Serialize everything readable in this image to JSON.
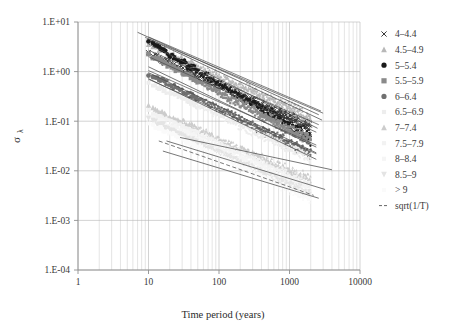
{
  "chart_data": {
    "type": "scatter",
    "title": "",
    "xlabel": "Time period (years)",
    "ylabel": "σλ",
    "xscale": "log",
    "yscale": "log",
    "xlim": [
      1,
      10000
    ],
    "ylim": [
      0.0001,
      10
    ],
    "xticks": [
      "1",
      "10",
      "100",
      "1000",
      "10000"
    ],
    "xtick_values": [
      1,
      10,
      100,
      1000,
      10000
    ],
    "yticks": [
      "1.E+01",
      "1.E+00",
      "1.E-01",
      "1.E-02",
      "1.E-03",
      "1.E-04"
    ],
    "ytick_values": [
      10,
      1,
      0.1,
      0.01,
      0.001,
      0.0001
    ],
    "grid": "both-log-minor",
    "legend_position": "right",
    "series": [
      {
        "name": "4–4.4",
        "marker": "cross",
        "color": "#3a3a3a",
        "x_start": 10,
        "x_end": 2000,
        "y_start": 2.3,
        "y_end": 0.075,
        "trend_y_start": 2.7,
        "trend_y_end": 0.085,
        "trend_x_end": 2600,
        "spread": 0.16
      },
      {
        "name": "4.5–4.9",
        "marker": "triangle",
        "color": "#b8b8b8",
        "x_start": 10,
        "x_end": 2000,
        "y_start": 3.6,
        "y_end": 0.115,
        "trend_y_start": 4.6,
        "trend_y_end": 0.145,
        "trend_x_end": 3000,
        "spread": 0.17
      },
      {
        "name": "5–5.4",
        "marker": "circle",
        "color": "#1a1a1a",
        "x_start": 10,
        "x_end": 2000,
        "y_start": 4.0,
        "y_end": 0.046,
        "trend_y_start": 5.0,
        "trend_y_end": 0.16,
        "trend_x_end": 2800,
        "spread": 0.15
      },
      {
        "name": "5.5–5.9",
        "marker": "square",
        "color": "#8a8a8a",
        "x_start": 10,
        "x_end": 2000,
        "y_start": 2.2,
        "y_end": 0.04,
        "trend_y_start": 2.0,
        "trend_y_end": 0.06,
        "trend_x_end": 2400,
        "spread": 0.15
      },
      {
        "name": "6–6.4",
        "marker": "circle",
        "color": "#707070",
        "x_start": 10,
        "x_end": 2000,
        "y_start": 0.88,
        "y_end": 0.022,
        "trend_y_start": 1.05,
        "trend_y_end": 0.033,
        "trend_x_end": 2400,
        "spread": 0.14
      },
      {
        "name": "6.5–6.9",
        "marker": "none",
        "color": "#ededed",
        "x_start": 10,
        "x_end": 2000,
        "y_start": 0.6,
        "y_end": 0.018,
        "trend_y_start": 0.7,
        "trend_y_end": 0.022,
        "trend_x_end": 2400,
        "spread": 0.14
      },
      {
        "name": "7–7.4",
        "marker": "triangle",
        "color": "#cccccc",
        "x_start": 10,
        "x_end": 2000,
        "y_start": 0.2,
        "y_end": 0.0062,
        "trend_y_start": 0.24,
        "trend_y_end": 0.0075,
        "trend_x_end": 2400,
        "spread": 0.14
      },
      {
        "name": "7.5–7.9",
        "marker": "none",
        "color": "#f2f2f2",
        "x_start": 10,
        "x_end": 2000,
        "y_start": 0.16,
        "y_end": 0.005,
        "trend_y_start": 0.19,
        "trend_y_end": 0.0058,
        "trend_x_end": 2400,
        "spread": 0.13
      },
      {
        "name": "8–8.4",
        "marker": "none",
        "color": "#f5f5f5",
        "x_start": 10,
        "x_end": 2000,
        "y_start": 0.13,
        "y_end": 0.004,
        "trend_y_start": 0.15,
        "trend_y_end": 0.0046,
        "trend_x_end": 2400,
        "spread": 0.13
      },
      {
        "name": "8.5–9",
        "marker": "triangle-down",
        "color": "#e4e4e4",
        "x_start": 10,
        "x_end": 2000,
        "y_start": 0.11,
        "y_end": 0.0033,
        "trend_y_start": 0.12,
        "trend_y_end": 0.0037,
        "trend_x_end": 2400,
        "spread": 0.12
      },
      {
        "name": "> 9",
        "marker": "none",
        "color": "#fafafa",
        "x_start": 10,
        "x_end": 2000,
        "y_start": 0.09,
        "y_end": 0.0027,
        "trend_y_start": 0.1,
        "trend_y_end": 0.003,
        "trend_x_end": 2400,
        "spread": 0.12
      },
      {
        "name": "sqrt(1/T)",
        "marker": "dashed-line",
        "color": "#555555",
        "x_start": 14,
        "x_end": 2200,
        "y_start": 0.04,
        "y_end": 0.0032,
        "trend_y_start": 0.04,
        "trend_y_end": 0.0032,
        "trend_x_end": 2200,
        "spread": 0
      }
    ],
    "reference_lines": [
      {
        "name": "ref-upper-1",
        "x_start": 7,
        "x_end": 2600,
        "y_start": 6.2,
        "y_end": 0.135,
        "color": "#4a4a4a"
      },
      {
        "name": "ref-upper-2",
        "x_start": 9,
        "x_end": 2900,
        "y_start": 4.9,
        "y_end": 0.105,
        "color": "#4a4a4a"
      },
      {
        "name": "ref-upper-3",
        "x_start": 10,
        "x_end": 2500,
        "y_start": 3.6,
        "y_end": 0.072,
        "color": "#4a4a4a"
      },
      {
        "name": "ref-mid-1",
        "x_start": 10,
        "x_end": 2400,
        "y_start": 1.25,
        "y_end": 0.03,
        "color": "#4a4a4a"
      },
      {
        "name": "ref-mid-2",
        "x_start": 10,
        "x_end": 2400,
        "y_start": 0.95,
        "y_end": 0.023,
        "color": "#4a4a4a"
      },
      {
        "name": "ref-mid-3",
        "x_start": 10,
        "x_end": 2400,
        "y_start": 0.72,
        "y_end": 0.017,
        "color": "#4a4a4a"
      },
      {
        "name": "ref-low-1",
        "x_start": 28,
        "x_end": 4000,
        "y_start": 0.047,
        "y_end": 0.0105,
        "color": "#4a4a4a"
      },
      {
        "name": "ref-low-2",
        "x_start": 18,
        "x_end": 3200,
        "y_start": 0.04,
        "y_end": 0.0042,
        "color": "#4a4a4a"
      },
      {
        "name": "ref-low-3",
        "x_start": 16,
        "x_end": 2600,
        "y_start": 0.025,
        "y_end": 0.0028,
        "color": "#4a4a4a"
      }
    ]
  },
  "legend": {
    "items": [
      {
        "label": "4–4.4",
        "marker": "cross",
        "color": "#3a3a3a"
      },
      {
        "label": "4.5–4.9",
        "marker": "triangle",
        "color": "#b8b8b8"
      },
      {
        "label": "5–5.4",
        "marker": "circle",
        "color": "#1a1a1a"
      },
      {
        "label": "5.5–5.9",
        "marker": "square",
        "color": "#8a8a8a"
      },
      {
        "label": "6–6.4",
        "marker": "circle",
        "color": "#707070"
      },
      {
        "label": "6.5–6.9",
        "marker": "none",
        "color": "#ededed"
      },
      {
        "label": "7–7.4",
        "marker": "triangle",
        "color": "#cccccc"
      },
      {
        "label": "7.5–7.9",
        "marker": "none",
        "color": "#f2f2f2"
      },
      {
        "label": "8–8.4",
        "marker": "none",
        "color": "#f5f5f5"
      },
      {
        "label": "8.5–9",
        "marker": "triangle-down",
        "color": "#e4e4e4"
      },
      {
        "label": "> 9",
        "marker": "none",
        "color": "#fafafa"
      },
      {
        "label": "sqrt(1/T)",
        "marker": "dashed-line",
        "color": "#555555"
      }
    ]
  },
  "axes": {
    "y_label_main": "σ",
    "y_label_sub": "λ",
    "x_label": "Time period (years)"
  },
  "colors": {
    "grid": "#c9c9c9",
    "axis": "#8f8f8f",
    "text": "#3a3a3a",
    "background": "#ffffff"
  }
}
